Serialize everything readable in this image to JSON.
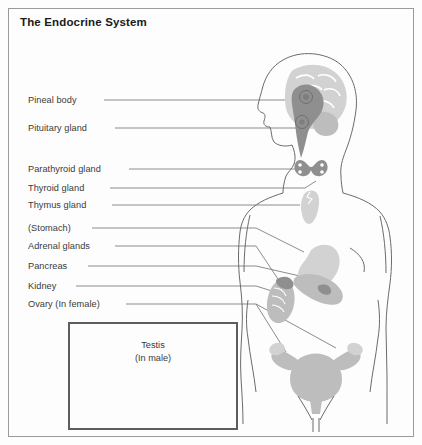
{
  "figure": {
    "title": "The Endocrine System",
    "border_color": "#9a9a9a",
    "background_color": "#fdfdfd"
  },
  "labels": [
    {
      "id": "pineal-body",
      "text": "Pineal body",
      "x": 28,
      "y": 95,
      "line_x1": 104,
      "line_y1": 100,
      "line_x2": 296,
      "line_y2": 100
    },
    {
      "id": "pituitary-gland",
      "text": "Pituitary gland",
      "x": 28,
      "y": 123,
      "line_x1": 115,
      "line_y1": 128,
      "line_x2": 290,
      "line_y2": 128
    },
    {
      "id": "parathyroid-gland",
      "text": "Parathyroid gland",
      "x": 28,
      "y": 164,
      "line_x1": 129,
      "line_y1": 169,
      "line_x2": 292,
      "line_y2": 169
    },
    {
      "id": "thyroid-gland",
      "text": "Thyroid gland",
      "x": 28,
      "y": 183,
      "line_x1": 110,
      "line_y1": 188,
      "line_x2": 300,
      "line_y2": 188
    },
    {
      "id": "thymus-gland",
      "text": "Thymus gland",
      "x": 28,
      "y": 200,
      "line_x1": 112,
      "line_y1": 205,
      "line_x2": 310,
      "line_y2": 205
    },
    {
      "id": "stomach",
      "text": "(Stomach)",
      "x": 28,
      "y": 223,
      "line_x1": 92,
      "line_y1": 228,
      "line_x2": 258,
      "line_y2": 228
    },
    {
      "id": "adrenal-glands",
      "text": "Adrenal glands",
      "x": 28,
      "y": 241,
      "line_x1": 115,
      "line_y1": 246,
      "line_x2": 258,
      "line_y2": 246
    },
    {
      "id": "pancreas",
      "text": "Pancreas",
      "x": 28,
      "y": 261,
      "line_x1": 88,
      "line_y1": 266,
      "line_x2": 258,
      "line_y2": 266
    },
    {
      "id": "kidney",
      "text": "Kidney",
      "x": 28,
      "y": 281,
      "line_x1": 76,
      "line_y1": 286,
      "line_x2": 258,
      "line_y2": 286
    },
    {
      "id": "ovary-in-female",
      "text": "Ovary (In female)",
      "x": 28,
      "y": 299,
      "line_x1": 126,
      "line_y1": 304,
      "line_x2": 258,
      "line_y2": 304
    }
  ],
  "inset": {
    "title_line1": "Testis",
    "title_line2": "(In male)",
    "border_color": "#5d5d5d"
  },
  "colors": {
    "organ_light": "#cfcfcf",
    "organ_mid": "#bdbdbd",
    "organ_dark": "#8d8d8d",
    "outline": "#6b6b6b",
    "leader_line": "#6e6e6e",
    "text": "#3a3a3a",
    "title_text": "#1a1a1a"
  }
}
